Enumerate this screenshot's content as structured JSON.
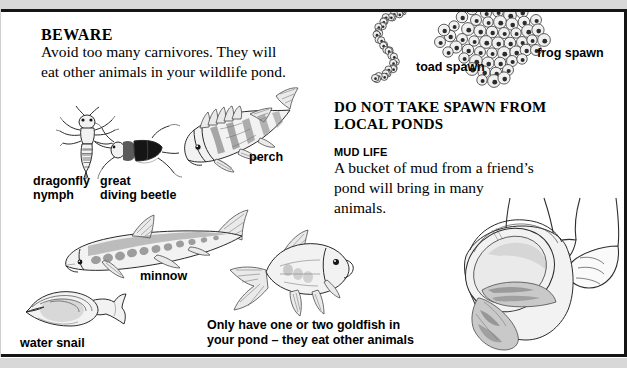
{
  "page": {
    "background_color": "#ffffff",
    "band_color": "#d8d8d8",
    "rule_color": "#151515"
  },
  "left_column": {
    "beware_heading": "BEWARE",
    "beware_body": "Avoid too many carnivores. They will eat other animals in your wildlife pond.",
    "goldfish_note": "Only have one or two goldfish in your pond – they eat other animals"
  },
  "right_column": {
    "do_not_take_heading": "DO NOT TAKE SPAWN FROM LOCAL PONDS",
    "mud_life_heading": "MUD LIFE",
    "mud_life_body": "A bucket of mud from a friend’s pond will bring in many animals."
  },
  "labels": {
    "dragonfly_nymph": "dragonfly\nnymph",
    "great_diving_beetle": "great\ndiving beetle",
    "perch": "perch",
    "minnow": "minnow",
    "water_snail": "water snail",
    "toad_spawn": "toad spawn",
    "frog_spawn": "frog spawn"
  },
  "illustrations": [
    {
      "name": "dragonfly-nymph-illustration",
      "label": "dragonfly nymph"
    },
    {
      "name": "great-diving-beetle-illustration",
      "label": "great diving beetle"
    },
    {
      "name": "perch-illustration",
      "label": "perch"
    },
    {
      "name": "minnow-illustration",
      "label": "minnow"
    },
    {
      "name": "goldfish-illustration",
      "label": "goldfish"
    },
    {
      "name": "water-snail-illustration",
      "label": "water snail"
    },
    {
      "name": "toad-spawn-illustration",
      "label": "toad spawn"
    },
    {
      "name": "frog-spawn-illustration",
      "label": "frog spawn"
    },
    {
      "name": "bucket-of-mud-illustration",
      "label": "hands pouring bucket of mud"
    }
  ]
}
